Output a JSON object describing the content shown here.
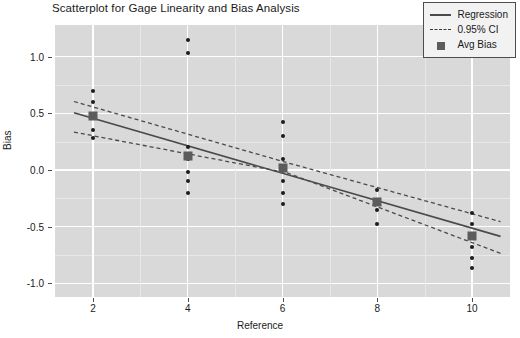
{
  "chart_data": {
    "type": "scatter",
    "title": "Scatterplot for Gage Linearity and Bias Analysis",
    "xlabel": "Reference",
    "ylabel": "Bias",
    "xlim": [
      1.2,
      10.8
    ],
    "ylim": [
      -1.12,
      1.28
    ],
    "xticks": [
      2,
      4,
      6,
      8,
      10
    ],
    "xtick_labels": [
      "2",
      "4",
      "6",
      "8",
      "10"
    ],
    "yticks": [
      1.0,
      0.5,
      0.0,
      -0.5,
      -1.0
    ],
    "ytick_labels": [
      "1.0",
      "0.5",
      "0.0",
      "-0.5",
      "-1.0"
    ],
    "grid": true,
    "grid_major_x": [
      2,
      3,
      4,
      5,
      6,
      7,
      8,
      9,
      10
    ],
    "grid_major_y": [
      1.0,
      0.5,
      0.0,
      -0.5,
      -1.0
    ],
    "grid_minor_y": [
      0.75,
      0.25,
      -0.25,
      -0.75
    ],
    "panel_background": "#d9d9d9",
    "gridline_color": "#ffffff",
    "point_color": "#1c1c1c",
    "avg_bias_color": "#5c5c5c",
    "line_color": "#4a4a4a",
    "legend_position": "top-right",
    "series": [
      {
        "name": "Bias",
        "type": "scatter",
        "points": [
          {
            "x": 2,
            "y": 0.7
          },
          {
            "x": 2,
            "y": 0.6
          },
          {
            "x": 2,
            "y": 0.35
          },
          {
            "x": 2,
            "y": 0.28
          },
          {
            "x": 4,
            "y": 1.15
          },
          {
            "x": 4,
            "y": 1.03
          },
          {
            "x": 4,
            "y": 0.2
          },
          {
            "x": 4,
            "y": 0.1
          },
          {
            "x": 4,
            "y": -0.02
          },
          {
            "x": 4,
            "y": -0.1
          },
          {
            "x": 4,
            "y": -0.2
          },
          {
            "x": 6,
            "y": 0.42
          },
          {
            "x": 6,
            "y": 0.3
          },
          {
            "x": 6,
            "y": 0.1
          },
          {
            "x": 6,
            "y": 0.02
          },
          {
            "x": 6,
            "y": -0.1
          },
          {
            "x": 6,
            "y": -0.2
          },
          {
            "x": 6,
            "y": -0.3
          },
          {
            "x": 8,
            "y": -0.18
          },
          {
            "x": 8,
            "y": -0.35
          },
          {
            "x": 8,
            "y": -0.48
          },
          {
            "x": 10,
            "y": -0.38
          },
          {
            "x": 10,
            "y": -0.48
          },
          {
            "x": 10,
            "y": -0.68
          },
          {
            "x": 10,
            "y": -0.78
          },
          {
            "x": 10,
            "y": -0.86
          }
        ]
      },
      {
        "name": "Avg Bias",
        "type": "marker",
        "points": [
          {
            "x": 2,
            "y": 0.475
          },
          {
            "x": 4,
            "y": 0.125
          },
          {
            "x": 6,
            "y": 0.02
          },
          {
            "x": 8,
            "y": -0.285
          },
          {
            "x": 10,
            "y": -0.585
          }
        ]
      },
      {
        "name": "Regression",
        "type": "line",
        "points": [
          {
            "x": 1.6,
            "y": 0.505
          },
          {
            "x": 10.6,
            "y": -0.585
          }
        ]
      },
      {
        "name": "0.95% CI upper",
        "type": "line-dashed",
        "points": [
          {
            "x": 1.6,
            "y": 0.605
          },
          {
            "x": 6.1,
            "y": 0.065
          },
          {
            "x": 10.6,
            "y": -0.455
          }
        ]
      },
      {
        "name": "0.95% CI lower",
        "type": "line-dashed",
        "points": [
          {
            "x": 1.6,
            "y": 0.335
          },
          {
            "x": 6.1,
            "y": -0.025
          },
          {
            "x": 10.6,
            "y": -0.735
          }
        ]
      }
    ],
    "legend": [
      {
        "label": "Regression",
        "key": "solid-line"
      },
      {
        "label": "0.95% CI",
        "key": "dashed-line"
      },
      {
        "label": "Avg Bias",
        "key": "square-marker"
      }
    ]
  }
}
